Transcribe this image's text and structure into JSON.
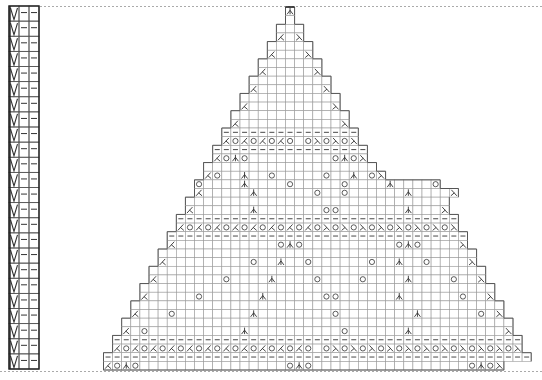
{
  "chart_title": "Lace triangle shawl knitting chart",
  "colors": {
    "grid": "#9a9a9a",
    "outline": "#555555",
    "symbol": "#333333",
    "dotted": "#aaaaaa",
    "background": "#ffffff"
  },
  "edge_column": {
    "rows": 24,
    "cells_per_row": [
      "V",
      "–",
      "–"
    ],
    "symbol_legend": {
      "V": "slip-stitch",
      "–": "purl"
    }
  },
  "grid": {
    "columns": 51,
    "x0": 58,
    "y0": 7,
    "cell_w": 9.1,
    "cell_h": 9.45
  },
  "symbol_legend": {
    "-": "purl",
    "o": "yarn-over",
    "<": "k2tog-left-decrease",
    ">": "ssk-right-decrease",
    "^": "central-double-decrease",
    " ": "knit"
  },
  "rows": [
    {
      "start": 25,
      "cells": "^"
    },
    {
      "start": 25,
      "cells": " "
    },
    {
      "start": 24,
      "cells": "   "
    },
    {
      "start": 24,
      "cells": "< >"
    },
    {
      "start": 23,
      "cells": "     "
    },
    {
      "start": 23,
      "cells": "<   >"
    },
    {
      "start": 22,
      "cells": "       "
    },
    {
      "start": 22,
      "cells": "<     >"
    },
    {
      "start": 21,
      "cells": "         "
    },
    {
      "start": 21,
      "cells": "<       >"
    },
    {
      "start": 20,
      "cells": "           "
    },
    {
      "start": 20,
      "cells": "<         >"
    },
    {
      "start": 19,
      "cells": "             "
    },
    {
      "start": 19,
      "cells": "<           >"
    },
    {
      "start": 18,
      "cells": "---------------"
    },
    {
      "start": 18,
      "cells": "<o<o<o<o o>o>o>"
    },
    {
      "start": 17,
      "cells": "-----------------"
    },
    {
      "start": 17,
      "cells": "<o^o         o^o>"
    },
    {
      "start": 16,
      "cells": "                   "
    },
    {
      "start": 16,
      "cells": "<o  ^  o     o  ^ o>"
    },
    {
      "start": 15,
      "cells": "o    ^    o     o    ^    o"
    },
    {
      "start": 15,
      "cells": "<     ^      o  o      ^    >"
    },
    {
      "start": 14,
      "cells": "                             "
    },
    {
      "start": 14,
      "cells": "<      ^       oo       ^   >"
    },
    {
      "start": 13,
      "cells": "-------------------------------"
    },
    {
      "start": 13,
      "cells": "<o<o<o<o<o<o<o<o>o>o>o>o>o>o>o>"
    },
    {
      "start": 12,
      "cells": "---------------------------------"
    },
    {
      "start": 12,
      "cells": "<           o^o          o^o    >"
    },
    {
      "start": 11,
      "cells": "                                   "
    },
    {
      "start": 11,
      "cells": "<         o  ^  o      o  ^  o    >"
    },
    {
      "start": 10,
      "cells": "                                     "
    },
    {
      "start": 10,
      "cells": "<       o    ^    o    o    ^    o  >"
    },
    {
      "start": 9,
      "cells": "                                       "
    },
    {
      "start": 9,
      "cells": "<     o      ^      oo      ^      o  >"
    },
    {
      "start": 8,
      "cells": "                                         "
    },
    {
      "start": 8,
      "cells": "<   o        ^        o        ^      o >"
    },
    {
      "start": 7,
      "cells": "                                           "
    },
    {
      "start": 7,
      "cells": "< o          ^          o      ^          >"
    },
    {
      "start": 6,
      "cells": "---------------------------------------------"
    },
    {
      "start": 6,
      "cells": "<o<o<o<o<o<o<o<o<o<o<o o>o>o>o>o>o>o>o>o>o>o>"
    },
    {
      "start": 5,
      "cells": "-----------------------------------------------"
    },
    {
      "start": 5,
      "cells": "<o^o                o^o                 o^o>"
    }
  ]
}
